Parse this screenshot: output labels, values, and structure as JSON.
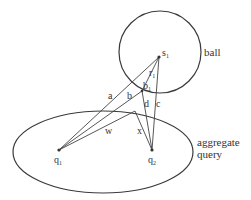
{
  "diagram": {
    "shapes": {
      "ball": {
        "label": "ball"
      },
      "query": {
        "label_line1": "aggregate",
        "label_line2": "query"
      }
    },
    "points": {
      "s1": {
        "label": "s",
        "sub": "1"
      },
      "q1": {
        "label": "q",
        "sub": "1"
      },
      "q2": {
        "label": "q",
        "sub": "2"
      }
    },
    "segment_labels": {
      "a": "a",
      "b": "b",
      "b1": "b",
      "b1_sub": "1",
      "r1": "r",
      "r1_sub": "1",
      "c": "c",
      "d": "d",
      "w": "w",
      "x": "x"
    },
    "colors": {
      "stroke": "#3a3a3a",
      "text": "#333333",
      "background": "#ffffff"
    }
  }
}
